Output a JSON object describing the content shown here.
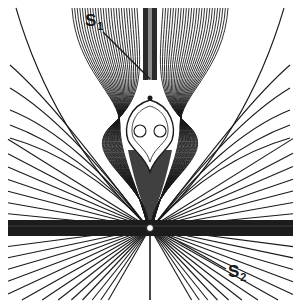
{
  "figure": {
    "type": "field-line / streamline plot",
    "background": "#ffffff",
    "line_color": "#1a1a1a",
    "center_point": {
      "x": 150,
      "y": 228
    },
    "band": {
      "y_top": 220,
      "y_bottom": 236,
      "x_left": 8,
      "x_right": 293
    },
    "funnel": {
      "top_y": 8,
      "left_x": 72,
      "right_x": 235,
      "stem_half_width": 7
    },
    "bulb": {
      "cx": 150,
      "cy": 128,
      "rx": 24,
      "ry": 26
    },
    "circles": [
      {
        "cx": 140,
        "cy": 131,
        "r": 6
      },
      {
        "cx": 160,
        "cy": 131,
        "r": 6
      }
    ],
    "fan_lines_per_side": 22
  },
  "labels": {
    "s1": {
      "base": "S",
      "sub": "1",
      "x": 85,
      "y": 12,
      "leader_to": {
        "x": 150,
        "y": 79
      }
    },
    "s2": {
      "base": "S",
      "sub": "2",
      "x": 228,
      "y": 263,
      "leader_from": {
        "x": 165,
        "y": 234
      }
    }
  }
}
